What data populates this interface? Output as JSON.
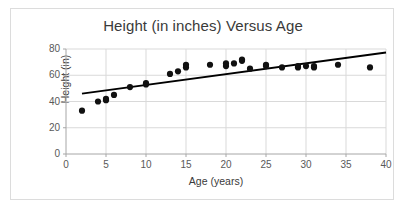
{
  "chart_data": {
    "type": "scatter",
    "title": "Height (in inches) Versus Age",
    "xlabel": "Age (years)",
    "ylabel": "Height (in)",
    "xlim": [
      0,
      40
    ],
    "ylim": [
      0,
      80
    ],
    "xticks": [
      0,
      5,
      10,
      15,
      20,
      25,
      30,
      35,
      40
    ],
    "yticks": [
      0,
      20,
      40,
      60,
      80
    ],
    "grid": "both-light-gray",
    "legend": "none",
    "marker_color": "#111111",
    "marker_shape": "circle",
    "gridline_color": "#d9d9d9",
    "axis_color": "#a6a6a6",
    "trendline": {
      "type": "linear",
      "color": "#000000",
      "x_start": 2,
      "y_start": 46,
      "x_end": 40,
      "y_end": 77.3,
      "slope": 0.824,
      "intercept": 44.35
    },
    "x": [
      2,
      4,
      5,
      5,
      6,
      8,
      10,
      10,
      13,
      14,
      15,
      15,
      18,
      20,
      20,
      21,
      22,
      22,
      23,
      25,
      25,
      27,
      29,
      29,
      30,
      31,
      31,
      34,
      38
    ],
    "y": [
      33,
      40,
      41,
      42,
      45,
      51,
      53,
      54,
      61,
      63,
      66,
      68,
      68,
      67,
      69,
      69,
      71,
      72,
      65,
      67,
      68,
      66,
      66,
      67,
      67,
      66,
      67,
      68,
      66
    ],
    "points": [
      {
        "age": 2,
        "height": 33
      },
      {
        "age": 4,
        "height": 40
      },
      {
        "age": 5,
        "height": 41
      },
      {
        "age": 5,
        "height": 42
      },
      {
        "age": 6,
        "height": 45
      },
      {
        "age": 8,
        "height": 51
      },
      {
        "age": 10,
        "height": 53
      },
      {
        "age": 10,
        "height": 54
      },
      {
        "age": 13,
        "height": 61
      },
      {
        "age": 14,
        "height": 63
      },
      {
        "age": 15,
        "height": 66
      },
      {
        "age": 15,
        "height": 68
      },
      {
        "age": 18,
        "height": 68
      },
      {
        "age": 20,
        "height": 67
      },
      {
        "age": 20,
        "height": 69
      },
      {
        "age": 21,
        "height": 69
      },
      {
        "age": 22,
        "height": 71
      },
      {
        "age": 22,
        "height": 72
      },
      {
        "age": 23,
        "height": 65
      },
      {
        "age": 25,
        "height": 67
      },
      {
        "age": 25,
        "height": 68
      },
      {
        "age": 27,
        "height": 66
      },
      {
        "age": 29,
        "height": 66
      },
      {
        "age": 29,
        "height": 67
      },
      {
        "age": 30,
        "height": 67
      },
      {
        "age": 31,
        "height": 66
      },
      {
        "age": 31,
        "height": 67
      },
      {
        "age": 34,
        "height": 68
      },
      {
        "age": 38,
        "height": 66
      }
    ]
  }
}
